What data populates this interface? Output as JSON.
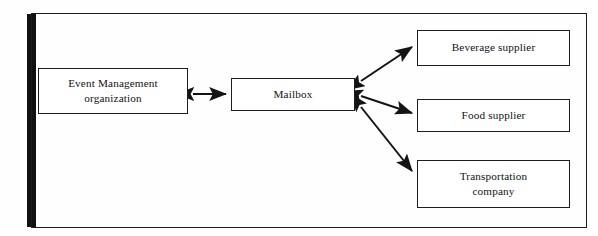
{
  "figure": {
    "type": "block-diagram",
    "frame_color": "#1b1b1b",
    "background_color": "#fefefe",
    "ink_color": "#111111"
  },
  "nodes": [
    {
      "id": "event-management",
      "label": "Event Management\norganization",
      "line1": "Event Management",
      "line2": "organization",
      "x": 38,
      "y": 68,
      "width": 150,
      "height": 46
    },
    {
      "id": "mailbox",
      "label": "Mailbox",
      "line1": "Mailbox",
      "line2": "",
      "x": 231,
      "y": 78,
      "width": 124,
      "height": 33
    },
    {
      "id": "beverage-supplier",
      "label": "Beverage supplier",
      "line1": "Beverage supplier",
      "line2": "",
      "x": 417,
      "y": 30,
      "width": 153,
      "height": 36
    },
    {
      "id": "food-supplier",
      "label": "Food supplier",
      "line1": "Food supplier",
      "line2": "",
      "x": 417,
      "y": 99,
      "width": 153,
      "height": 33
    },
    {
      "id": "transportation-company",
      "label": "Transportation\ncompany",
      "line1": "Transportation",
      "line2": "company",
      "x": 417,
      "y": 160,
      "width": 153,
      "height": 48
    }
  ],
  "connections": [
    {
      "id": "event-management-to-mailbox",
      "from": "event-management",
      "to": "mailbox",
      "style": "double-headed",
      "x1": 192,
      "y1": 94,
      "x2": 227,
      "y2": 94
    },
    {
      "id": "mailbox-to-beverage-supplier",
      "from": "mailbox",
      "to": "beverage-supplier",
      "style": "double-headed",
      "x1": 360,
      "y1": 80,
      "x2": 413,
      "y2": 46
    },
    {
      "id": "mailbox-to-food-supplier",
      "from": "mailbox",
      "to": "food-supplier",
      "style": "double-headed",
      "x1": 360,
      "y1": 95,
      "x2": 413,
      "y2": 113
    },
    {
      "id": "mailbox-to-transportation-company",
      "from": "mailbox",
      "to": "transportation-company",
      "style": "double-headed",
      "x1": 360,
      "y1": 106,
      "x2": 413,
      "y2": 172
    }
  ]
}
